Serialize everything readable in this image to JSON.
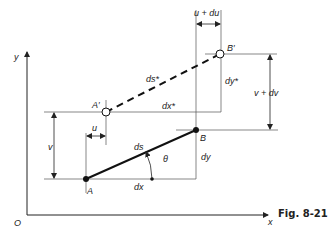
{
  "figure": {
    "caption": "Fig. 8-21",
    "axes": {
      "origin": "O",
      "x": "x",
      "y": "y"
    },
    "points": {
      "A": "A",
      "B": "B",
      "A_prime": "A′",
      "B_prime": "B′"
    },
    "segments": {
      "original": {
        "length": "ds",
        "run": "dx",
        "rise": "dy",
        "angle": "θ"
      },
      "deformed": {
        "length": "ds*",
        "run": "dx*",
        "rise": "dy*"
      }
    },
    "dimensions": {
      "u": "u",
      "v": "v",
      "u_plus_du": "u + du",
      "v_plus_dv": "v + dv"
    }
  }
}
